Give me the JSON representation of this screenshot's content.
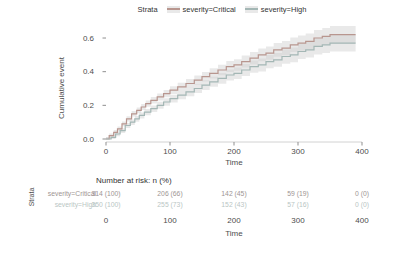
{
  "legend": {
    "title": "Strata",
    "items": [
      {
        "label": "severity=Critical",
        "color": "#b8968f"
      },
      {
        "label": "severity=High",
        "color": "#a4b7b5"
      }
    ]
  },
  "chart_data": {
    "type": "line",
    "subtype": "step-cumulative-incidence",
    "title": "",
    "xlabel": "Time",
    "ylabel": "Cumulative event",
    "xlim": [
      0,
      400
    ],
    "ylim": [
      0,
      0.65
    ],
    "grid": false,
    "legend_position": "top",
    "xticks": [
      {
        "label": "0",
        "value": 0
      },
      {
        "label": "100",
        "value": 100
      },
      {
        "label": "200",
        "value": 200
      },
      {
        "label": "300",
        "value": 300
      },
      {
        "label": "400",
        "value": 400
      }
    ],
    "yticks": [
      {
        "label": "0.0",
        "value": 0.0
      },
      {
        "label": "0.2",
        "value": 0.2
      },
      {
        "label": "0.4",
        "value": 0.4
      },
      {
        "label": "0.6",
        "value": 0.6
      }
    ],
    "ribbon_color": "#cfcfcf",
    "ci_halfwidth": {
      "start": 0.012,
      "end": 0.055
    },
    "series": [
      {
        "name": "severity=Critical",
        "color": "#b8968f",
        "points": [
          [
            0,
            0
          ],
          [
            5,
            0.02
          ],
          [
            12,
            0.04
          ],
          [
            18,
            0.06
          ],
          [
            25,
            0.09
          ],
          [
            32,
            0.12
          ],
          [
            40,
            0.15
          ],
          [
            48,
            0.17
          ],
          [
            55,
            0.19
          ],
          [
            62,
            0.21
          ],
          [
            70,
            0.23
          ],
          [
            80,
            0.25
          ],
          [
            90,
            0.27
          ],
          [
            100,
            0.29
          ],
          [
            112,
            0.31
          ],
          [
            125,
            0.33
          ],
          [
            138,
            0.35
          ],
          [
            150,
            0.37
          ],
          [
            162,
            0.39
          ],
          [
            175,
            0.41
          ],
          [
            188,
            0.43
          ],
          [
            200,
            0.44
          ],
          [
            212,
            0.46
          ],
          [
            225,
            0.48
          ],
          [
            238,
            0.5
          ],
          [
            250,
            0.51
          ],
          [
            262,
            0.53
          ],
          [
            275,
            0.54
          ],
          [
            288,
            0.56
          ],
          [
            300,
            0.57
          ],
          [
            312,
            0.58
          ],
          [
            325,
            0.6
          ],
          [
            338,
            0.61
          ],
          [
            350,
            0.62
          ],
          [
            390,
            0.62
          ]
        ]
      },
      {
        "name": "severity=High",
        "color": "#a4b7b5",
        "points": [
          [
            0,
            0
          ],
          [
            8,
            0.01
          ],
          [
            15,
            0.03
          ],
          [
            22,
            0.05
          ],
          [
            30,
            0.08
          ],
          [
            38,
            0.1
          ],
          [
            45,
            0.12
          ],
          [
            52,
            0.14
          ],
          [
            60,
            0.16
          ],
          [
            70,
            0.18
          ],
          [
            80,
            0.2
          ],
          [
            90,
            0.22
          ],
          [
            100,
            0.24
          ],
          [
            112,
            0.26
          ],
          [
            125,
            0.28
          ],
          [
            138,
            0.3
          ],
          [
            150,
            0.32
          ],
          [
            162,
            0.34
          ],
          [
            175,
            0.36
          ],
          [
            188,
            0.38
          ],
          [
            200,
            0.39
          ],
          [
            212,
            0.41
          ],
          [
            225,
            0.43
          ],
          [
            238,
            0.44
          ],
          [
            250,
            0.46
          ],
          [
            262,
            0.47
          ],
          [
            275,
            0.49
          ],
          [
            288,
            0.5
          ],
          [
            300,
            0.52
          ],
          [
            312,
            0.53
          ],
          [
            325,
            0.55
          ],
          [
            338,
            0.56
          ],
          [
            350,
            0.57
          ],
          [
            390,
            0.57
          ]
        ]
      }
    ]
  },
  "risk_table": {
    "title": "Number at risk: n (%)",
    "axis_label": "Strata",
    "xlabel": "Time",
    "rows": [
      {
        "label": "severity=Critical",
        "color": "#9e9593",
        "values": [
          "314 (100)",
          "206 (66)",
          "142 (45)",
          "59 (19)",
          "0 (0)"
        ]
      },
      {
        "label": "severity=High",
        "color": "#b9c6c4",
        "values": [
          "350 (100)",
          "255 (73)",
          "152 (43)",
          "57 (16)",
          "0 (0)"
        ]
      }
    ]
  },
  "style": {
    "axis_line_color": "#d2d2d2",
    "tick_color": "#8f8f8f"
  }
}
